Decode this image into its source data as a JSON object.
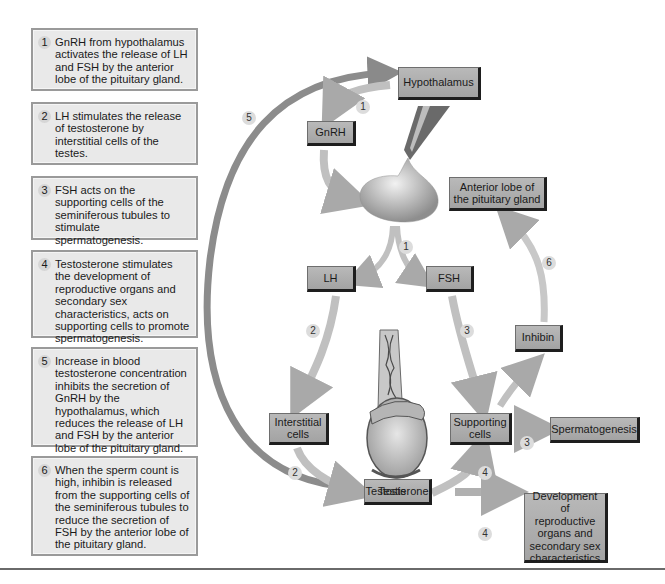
{
  "steps": [
    {
      "num": "1",
      "text": "GnRH from hypothalamus activates the release of LH and FSH by the anterior lobe of the pituitary gland."
    },
    {
      "num": "2",
      "text": "LH stimulates the release of testosterone by interstitial cells of the testes."
    },
    {
      "num": "3",
      "text": "FSH acts on the supporting cells of the seminiferous tubules to stimulate spermatogenesis."
    },
    {
      "num": "4",
      "text": "Testosterone stimulates the development of reproductive organs and secondary sex characteristics, acts on supporting cells to promote spermatogenesis."
    },
    {
      "num": "5",
      "text": "Increase in blood testosterone concentration inhibits the secretion of GnRH by the hypothalamus, which reduces the release of LH and FSH by the anterior lobe of the pituitary gland."
    },
    {
      "num": "6",
      "text": "When the sperm count is high, inhibin is released from the supporting cells of the seminiferous tubules to reduce the secretion of FSH by the anterior lobe of the pituitary gland."
    }
  ],
  "nodes": {
    "hypothalamus": "Hypothalamus",
    "gnrh": "GnRH",
    "anterior_lobe": "Anterior lobe of the pituitary gland",
    "lh": "LH",
    "fsh": "FSH",
    "inhibin": "Inhibin",
    "interstitial": "Interstitial cells",
    "supporting": "Supporting cells",
    "spermatogenesis": "Spermatogenesis",
    "testosterone": "Testosterone",
    "development": "Development of reproductive organs and secondary sex characteristics"
  },
  "labels": {
    "testis": "Testis"
  },
  "badges": {
    "b1_top": "1",
    "b1_mid": "1",
    "b2_upper": "2",
    "b2_lower": "2",
    "b3_upper": "3",
    "b3_lower": "3",
    "b4_upper": "4",
    "b4_lower": "4",
    "b5": "5",
    "b6": "6"
  },
  "colors": {
    "node_fill": "#afafaf",
    "node_shadow": "#1e1e1e",
    "step_fill": "#e9e9e9",
    "step_border": "#9a9a9a",
    "arrow": "#b8b8b8",
    "feedback_arrow": "#8c8c8c"
  }
}
